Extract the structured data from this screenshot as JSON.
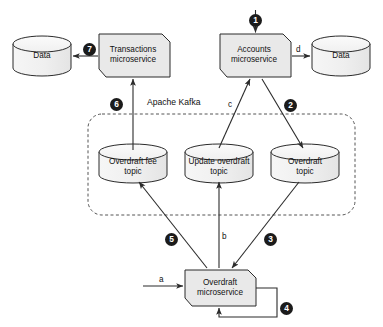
{
  "diagram": {
    "kafka_boundary_label": "Apache Kafka",
    "services": [
      {
        "id": "transactions",
        "label": "Transactions\nmicroservice",
        "shape": "notched-box"
      },
      {
        "id": "accounts",
        "label": "Accounts\nmicroservice",
        "shape": "notched-box"
      },
      {
        "id": "overdraft",
        "label": "Overdraft\nmicroservice",
        "shape": "notched-box"
      }
    ],
    "datastores": [
      {
        "id": "data-left",
        "label": "Data",
        "shape": "cylinder"
      },
      {
        "id": "data-right",
        "label": "Data",
        "shape": "cylinder"
      }
    ],
    "topics": [
      {
        "id": "overdraft-fee-topic",
        "label": "Overdraft fee\ntopic",
        "shape": "cylinder"
      },
      {
        "id": "update-overdraft-topic",
        "label": "Update overdraft\ntopic",
        "shape": "cylinder"
      },
      {
        "id": "overdraft-topic",
        "label": "Overdraft\ntopic",
        "shape": "cylinder"
      }
    ],
    "numbered_steps": [
      {
        "n": "1",
        "from": "external",
        "to": "accounts"
      },
      {
        "n": "2",
        "from": "accounts",
        "to": "overdraft-topic"
      },
      {
        "n": "3",
        "from": "overdraft-topic",
        "to": "overdraft"
      },
      {
        "n": "4",
        "from": "overdraft",
        "to": "overdraft"
      },
      {
        "n": "5",
        "from": "overdraft",
        "to": "overdraft-fee-topic"
      },
      {
        "n": "6",
        "from": "overdraft-fee-topic",
        "to": "transactions"
      },
      {
        "n": "7",
        "from": "transactions",
        "to": "data-left"
      }
    ],
    "lettered_steps": [
      {
        "letter": "a",
        "from": "external",
        "to": "overdraft"
      },
      {
        "letter": "b",
        "from": "overdraft",
        "to": "update-overdraft-topic"
      },
      {
        "letter": "c",
        "from": "update-overdraft-topic",
        "to": "accounts"
      },
      {
        "letter": "d",
        "from": "accounts",
        "to": "data-right"
      }
    ],
    "colors": {
      "stroke": "#2b2b2b",
      "fill_service": "#e9e9e9",
      "fill_cylinder": "#f2f2f2",
      "badge_bg": "#1b1b1b",
      "badge_text": "#ffffff",
      "dashed": "#555555"
    }
  }
}
